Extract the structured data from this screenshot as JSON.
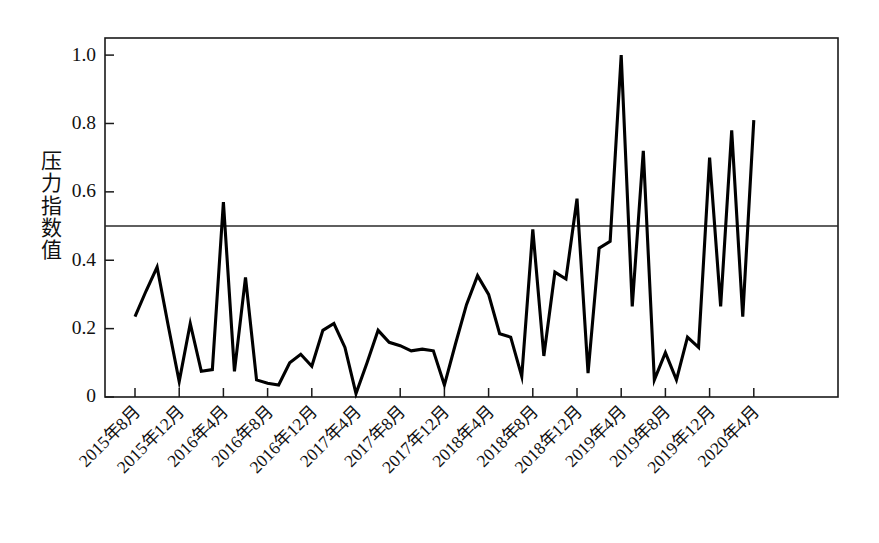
{
  "chart_data": {
    "type": "line",
    "title": "",
    "xlabel": "",
    "ylabel": "压力指数值",
    "ylim": [
      0,
      1.05
    ],
    "ytick_labels": [
      "0",
      "0.2",
      "0.4",
      "0.6",
      "0.8",
      "1.0"
    ],
    "ytick_values": [
      0,
      0.2,
      0.4,
      0.6,
      0.8,
      1.0
    ],
    "grid": false,
    "legend": "none",
    "reference_line": {
      "value": 0.5,
      "label": ""
    },
    "xtick_labels": [
      "2015年8月",
      "2015年12月",
      "2016年4月",
      "2016年8月",
      "2016年12月",
      "2017年4月",
      "2017年8月",
      "2017年12月",
      "2018年4月",
      "2018年8月",
      "2018年12月",
      "2019年4月",
      "2019年8月",
      "2019年12月",
      "2020年4月"
    ],
    "xtick_indices": [
      0,
      4,
      8,
      12,
      16,
      20,
      24,
      28,
      32,
      36,
      40,
      44,
      48,
      52,
      56
    ],
    "x": [
      "2015年8月",
      "2015年9月",
      "2015年10月",
      "2015年11月",
      "2015年12月",
      "2016年1月",
      "2016年2月",
      "2016年3月",
      "2016年4月",
      "2016年5月",
      "2016年6月",
      "2016年7月",
      "2016年8月",
      "2016年9月",
      "2016年10月",
      "2016年11月",
      "2016年12月",
      "2017年1月",
      "2017年2月",
      "2017年3月",
      "2017年4月",
      "2017年5月",
      "2017年6月",
      "2017年7月",
      "2017年8月",
      "2017年9月",
      "2017年10月",
      "2017年11月",
      "2017年12月",
      "2018年1月",
      "2018年2月",
      "2018年3月",
      "2018年4月",
      "2018年5月",
      "2018年6月",
      "2018年7月",
      "2018年8月",
      "2018年9月",
      "2018年10月",
      "2018年11月",
      "2018年12月",
      "2019年1月",
      "2019年2月",
      "2019年3月",
      "2019年4月",
      "2019年5月",
      "2019年6月",
      "2019年7月",
      "2019年8月",
      "2019年9月",
      "2019年10月",
      "2019年11月",
      "2019年12月",
      "2020年1月",
      "2020年2月",
      "2020年3月",
      "2020年4月"
    ],
    "series": [
      {
        "name": "压力指数值",
        "values": [
          0.235,
          0.31,
          0.38,
          0.21,
          0.045,
          0.215,
          0.075,
          0.08,
          0.57,
          0.075,
          0.35,
          0.05,
          0.04,
          0.035,
          0.1,
          0.125,
          0.09,
          0.195,
          0.215,
          0.145,
          0.01,
          0.1,
          0.195,
          0.16,
          0.15,
          0.135,
          0.14,
          0.135,
          0.035,
          0.155,
          0.27,
          0.355,
          0.3,
          0.185,
          0.175,
          0.06,
          0.49,
          0.12,
          0.365,
          0.345,
          0.58,
          0.07,
          0.435,
          0.455,
          1.0,
          0.265,
          0.72,
          0.05,
          0.13,
          0.05,
          0.175,
          0.145,
          0.7,
          0.265,
          0.78,
          0.235,
          0.81
        ]
      }
    ]
  },
  "axis": {
    "y_title_chars": [
      "压",
      "力",
      "指",
      "数",
      "值"
    ]
  }
}
